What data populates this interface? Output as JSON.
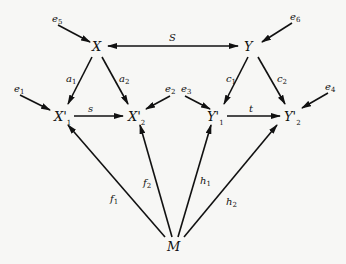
{
  "diagram": {
    "type": "path-diagram",
    "nodes": {
      "X": {
        "label": "X",
        "sub": ""
      },
      "Y": {
        "label": "Y",
        "sub": ""
      },
      "X1": {
        "label": "X'",
        "sub": "1"
      },
      "X2": {
        "label": "X'",
        "sub": "2"
      },
      "Y1": {
        "label": "Y'",
        "sub": "1"
      },
      "Y2": {
        "label": "Y'",
        "sub": "2"
      },
      "M": {
        "label": "M",
        "sub": ""
      }
    },
    "errors": {
      "e5": {
        "label": "e",
        "sub": "5"
      },
      "e6": {
        "label": "e",
        "sub": "6"
      },
      "e1": {
        "label": "e",
        "sub": "1"
      },
      "e2": {
        "label": "e",
        "sub": "2"
      },
      "e3": {
        "label": "e",
        "sub": "3"
      },
      "e4": {
        "label": "e",
        "sub": "4"
      }
    },
    "edges": {
      "S": {
        "label": "S",
        "sub": "",
        "from": "X",
        "to": "Y",
        "bidirectional": true
      },
      "a1": {
        "label": "a",
        "sub": "1",
        "from": "X",
        "to": "X'1"
      },
      "a2": {
        "label": "a",
        "sub": "2",
        "from": "X",
        "to": "X'2"
      },
      "c1": {
        "label": "c",
        "sub": "1",
        "from": "Y",
        "to": "Y'1"
      },
      "c2": {
        "label": "c",
        "sub": "2",
        "from": "Y",
        "to": "Y'2"
      },
      "s": {
        "label": "s",
        "sub": "",
        "from": "X'1",
        "to": "X'2"
      },
      "t": {
        "label": "t",
        "sub": "",
        "from": "Y'1",
        "to": "Y'2"
      },
      "f1": {
        "label": "f",
        "sub": "1",
        "from": "M",
        "to": "X'1"
      },
      "f2": {
        "label": "f",
        "sub": "2",
        "from": "M",
        "to": "X'2"
      },
      "h1": {
        "label": "h",
        "sub": "1",
        "from": "M",
        "to": "Y'1"
      },
      "h2": {
        "label": "h",
        "sub": "2",
        "from": "M",
        "to": "Y'2"
      }
    },
    "colors": {
      "stroke": "#111111",
      "background": "#f7f7f5"
    }
  }
}
